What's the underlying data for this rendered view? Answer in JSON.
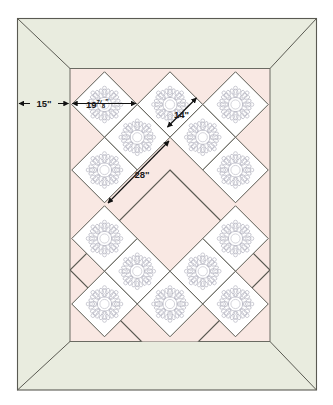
{
  "diagram": {
    "type": "quilt-layout-diagram",
    "colors": {
      "border_fabric": "#e9ecdf",
      "inner_background": "#f9e8e3",
      "block_background": "#ffffff",
      "outline": "#5a5a52",
      "motif": "#b9b9c4",
      "dimension_line": "#111111",
      "page_background": "#ffffff"
    },
    "regions": [
      {
        "name": "outer-border",
        "label": "Outer mitered border",
        "fill": "#e9ecdf"
      },
      {
        "name": "inner-quilt-field",
        "label": "Pink setting field",
        "fill": "#f9e8e3"
      },
      {
        "name": "center-diamond",
        "label": "Large center diamond",
        "fill": "#f9e8e3"
      }
    ],
    "dimensions": [
      {
        "id": "border-width",
        "value": "15",
        "unit": "\"",
        "text": "15\"",
        "orientation": "horizontal",
        "description": "Outer border finished width"
      },
      {
        "id": "block-diagonal",
        "whole": "19",
        "numerator": "7",
        "denominator": "8",
        "unit": "\"",
        "text": "19 7/8\"",
        "orientation": "horizontal",
        "description": "Block diagonal measurement across one on-point block"
      },
      {
        "id": "block-side",
        "value": "14",
        "unit": "\"",
        "text": "14\"",
        "orientation": "diagonal",
        "description": "Finished side of each appliqued block"
      },
      {
        "id": "center-diamond-side",
        "value": "28",
        "unit": "\"",
        "text": "28\"",
        "orientation": "diagonal",
        "description": "Side of the large center diamond"
      }
    ],
    "blocks": {
      "motif_name": "eight-point-snowflake-applique",
      "count": 14,
      "positions": [
        {
          "cx": 104.5,
          "cy": 104.5
        },
        {
          "cx": 170.0,
          "cy": 104.5
        },
        {
          "cx": 235.5,
          "cy": 104.5
        },
        {
          "cx": 137.2,
          "cy": 137.2
        },
        {
          "cx": 202.7,
          "cy": 137.2
        },
        {
          "cx": 104.5,
          "cy": 170.0
        },
        {
          "cx": 235.5,
          "cy": 170.0
        },
        {
          "cx": 104.5,
          "cy": 238.5
        },
        {
          "cx": 235.5,
          "cy": 238.5
        },
        {
          "cx": 137.2,
          "cy": 271.2
        },
        {
          "cx": 202.7,
          "cy": 271.2
        },
        {
          "cx": 104.5,
          "cy": 304.0
        },
        {
          "cx": 170.0,
          "cy": 304.0
        },
        {
          "cx": 235.5,
          "cy": 304.0
        }
      ]
    }
  }
}
